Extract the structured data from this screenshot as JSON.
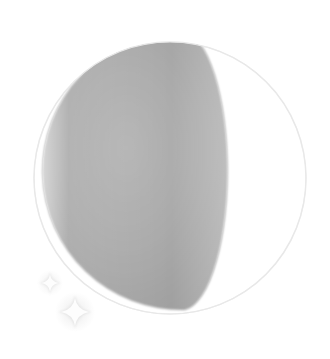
{
  "scene": {
    "name": "moon-phase-illustration",
    "title": "Moon phase illustration",
    "background_color": "#ffffff",
    "width": 330,
    "height": 359
  },
  "moon": {
    "name": "moon-disc",
    "phase_label": "Waning gibbous",
    "center_x": 170,
    "center_y": 178,
    "radius": 136,
    "outline_color": "#ededed",
    "lit_color": "#ffffff",
    "shadow_color": "#a9a9a9",
    "shadow_color_light": "#bcbcbc",
    "shadow_color_dark": "#9b9b9b",
    "terminator": {
      "name": "terminator-curve",
      "top_x": 178,
      "top_y": 32,
      "bottom_x": 185,
      "bottom_y": 310,
      "bulge_x": 216,
      "rx": 46,
      "ry": 139
    }
  },
  "sparkles": [
    {
      "name": "sparkle-small",
      "cx": 50,
      "cy": 283,
      "size": 22,
      "color": "#e4e4e4",
      "glow_color": "#f4f4f4"
    },
    {
      "name": "sparkle-large",
      "cx": 75,
      "cy": 312,
      "size": 34,
      "color": "#e0e0e0",
      "glow_color": "#f2f2f2"
    }
  ]
}
